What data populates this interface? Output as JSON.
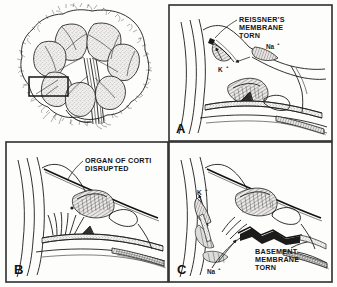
{
  "figure": {
    "background_color": "#fdfdfc",
    "ink_color": "#1b1b1b",
    "frame_color": "#2e2e2e",
    "width": 337,
    "height": 287
  },
  "overview": {
    "name": "cochlea-cross-section",
    "has_border": false,
    "highlight_box": {
      "label": "region-of-interest-box",
      "x": 29,
      "y": 77,
      "width": 39,
      "height": 19
    }
  },
  "panels": [
    {
      "id": "A",
      "letter": "A",
      "callout": {
        "lines": [
          "REISSNER'S",
          "MEMBRANE",
          "TORN"
        ]
      },
      "ions": [
        {
          "symbol": "K",
          "charge": "+",
          "label": "K+",
          "position": "lower-left"
        },
        {
          "symbol": "Na",
          "charge": "+",
          "label": "Na+",
          "position": "upper-right"
        }
      ]
    },
    {
      "id": "B",
      "letter": "B",
      "callout": {
        "lines": [
          "ORGAN OF CORTI",
          "DISRUPTED"
        ]
      },
      "ions": []
    },
    {
      "id": "C",
      "letter": "C",
      "callout": {
        "lines": [
          "BASEMENT",
          "MEMBRANE",
          "TORN"
        ]
      },
      "ions": [
        {
          "symbol": "K",
          "charge": "+",
          "label": "K+",
          "position": "upper-left"
        },
        {
          "symbol": "Na",
          "charge": "+",
          "label": "Na+",
          "position": "lower-left"
        }
      ]
    }
  ]
}
